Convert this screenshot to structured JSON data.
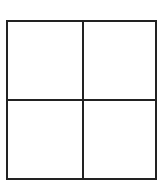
{
  "diagram": {
    "type": "2x2-grid",
    "rows": 2,
    "columns": 2,
    "line_color": "#222222",
    "background_color": "#ffffff",
    "cells": [
      {
        "row": 0,
        "col": 0,
        "label": ""
      },
      {
        "row": 0,
        "col": 1,
        "label": ""
      },
      {
        "row": 1,
        "col": 0,
        "label": ""
      },
      {
        "row": 1,
        "col": 1,
        "label": ""
      }
    ]
  }
}
